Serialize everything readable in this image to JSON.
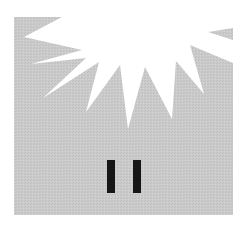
{
  "illustration": {
    "description": "Pause symbol beneath a white starburst on a gray halftone square",
    "icon": "pause-icon",
    "starburst": "starburst-icon",
    "colors": {
      "background": "#ffffff",
      "panel": "#c9c9c9",
      "burst": "#ffffff",
      "bars": "#161616"
    }
  }
}
